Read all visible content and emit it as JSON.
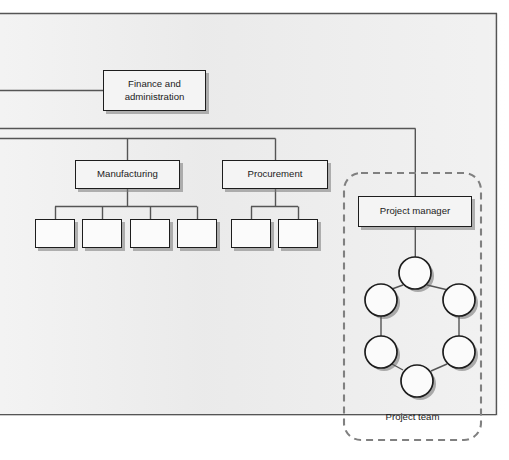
{
  "diagram": {
    "background_color": "#eeeeee",
    "line_color": "#555555",
    "node_border_color": "#1d1d1d",
    "node_fill_color": "#f4f4f4",
    "dashed_border_color": "#777777"
  },
  "nodes": {
    "finance": {
      "label_line1": "Finance and",
      "label_line2": "administration",
      "x": 103,
      "y": 70,
      "w": 103,
      "h": 41
    },
    "manufacturing": {
      "label": "Manufacturing",
      "x": 75,
      "y": 160,
      "w": 105,
      "h": 29
    },
    "procurement": {
      "label": "Procurement",
      "x": 222,
      "y": 160,
      "w": 106,
      "h": 29
    },
    "project_manager": {
      "label": "Project manager",
      "x": 358,
      "y": 196,
      "w": 114,
      "h": 31
    }
  },
  "manufacturing_children": [
    {
      "label": "",
      "x": 35,
      "y": 219,
      "w": 40,
      "h": 29
    },
    {
      "label": "",
      "x": 82,
      "y": 219,
      "w": 40,
      "h": 29
    },
    {
      "label": "",
      "x": 130,
      "y": 219,
      "w": 40,
      "h": 29
    },
    {
      "label": "",
      "x": 177,
      "y": 219,
      "w": 40,
      "h": 29
    }
  ],
  "procurement_children": [
    {
      "label": "",
      "x": 231,
      "y": 219,
      "w": 40,
      "h": 29
    },
    {
      "label": "",
      "x": 278,
      "y": 219,
      "w": 40,
      "h": 29
    }
  ],
  "project_team": {
    "caption": "Project team",
    "caption_x": 412,
    "caption_y": 417,
    "container": {
      "x": 344,
      "y": 173,
      "w": 137,
      "h": 267,
      "radius": 16
    },
    "member_count": 6,
    "circle_radius": 16,
    "members": [
      {
        "name": "team-member-top",
        "cx": 415,
        "cy": 273
      },
      {
        "name": "team-member-upper-left",
        "cx": 381,
        "cy": 300
      },
      {
        "name": "team-member-upper-right",
        "cx": 459,
        "cy": 300
      },
      {
        "name": "team-member-lower-left",
        "cx": 381,
        "cy": 352
      },
      {
        "name": "team-member-lower-right",
        "cx": 459,
        "cy": 352
      },
      {
        "name": "team-member-bottom",
        "cx": 417,
        "cy": 381
      }
    ],
    "links": [
      [
        0,
        1
      ],
      [
        0,
        2
      ],
      [
        1,
        3
      ],
      [
        2,
        4
      ],
      [
        3,
        5
      ],
      [
        4,
        5
      ]
    ]
  },
  "connectors": {
    "outer_border": {
      "left": 0,
      "top": 13,
      "right": 497,
      "bottom": 415
    },
    "finance_feed_y": 90,
    "ops_bus_y": 128,
    "ops_bus_secondary_y": 138,
    "project_drop_x": 415,
    "manufacturing_stem_x": 127,
    "procurement_stem_x": 275,
    "leaf_bus_y": 206
  }
}
